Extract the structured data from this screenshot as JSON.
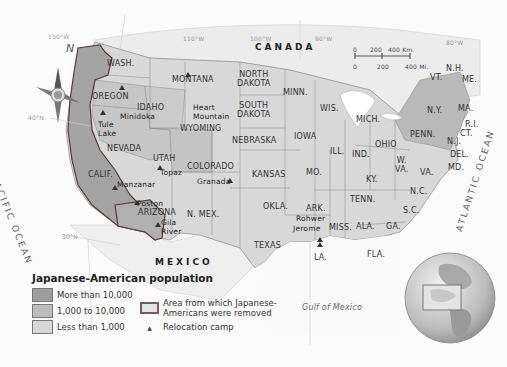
{
  "map": {
    "title": "Japanese-American population",
    "countries": {
      "canada": "CANADA",
      "mexico": "MEXICO"
    },
    "water": {
      "pacific": "PACIFIC OCEAN",
      "atlantic": "ATLANTIC OCEAN",
      "gulf": "Gulf of Mexico"
    },
    "coordinates": {
      "lon150": "150°W",
      "lon110": "110°W",
      "lon100": "100°W",
      "lon90": "90°W",
      "lon80": "80°W",
      "lat40": "40°N",
      "lat30": "30°N"
    },
    "compass": {
      "north": "N"
    },
    "scale": {
      "km_0": "0",
      "km_200": "200",
      "km_400": "400 Km.",
      "mi_0": "0",
      "mi_200": "200",
      "mi_400": "400 Mi."
    },
    "states": {
      "wash": "WASH.",
      "oregon": "OREGON",
      "idaho": "IDAHO",
      "montana": "MONTANA",
      "wyoming": "WYOMING",
      "nevada": "NEVADA",
      "calif": "CALIF.",
      "utah": "UTAH",
      "arizona": "ARIZONA",
      "colorado": "COLORADO",
      "nmex": "N. MEX.",
      "north_dakota_1": "NORTH",
      "north_dakota_2": "DAKOTA",
      "south_dakota_1": "SOUTH",
      "south_dakota_2": "DAKOTA",
      "nebraska": "NEBRASKA",
      "kansas": "KANSAS",
      "okla": "OKLA.",
      "texas": "TEXAS",
      "minn": "MINN.",
      "iowa": "IOWA",
      "mo": "MO.",
      "ark": "ARK.",
      "la": "LA.",
      "wis": "WIS.",
      "ill": "ILL.",
      "mich": "MICH.",
      "ind": "IND.",
      "ohio": "OHIO",
      "ky": "KY.",
      "tenn": "TENN.",
      "miss": "MISS.",
      "ala": "ALA.",
      "ga": "GA.",
      "fla": "FLA.",
      "sc": "S.C.",
      "nc": "N.C.",
      "va": "VA.",
      "wva_1": "W.",
      "wva_2": "VA.",
      "penn": "PENN.",
      "ny": "N.Y.",
      "vt": "VT.",
      "nh": "N.H.",
      "me": "ME.",
      "ma": "MA.",
      "ri": "R.I.",
      "ct": "CT.",
      "nj": "N.J.",
      "del": "DEL.",
      "md": "MD."
    },
    "camps": [
      {
        "name": "Minidoka"
      },
      {
        "name": "Heart Mountain",
        "line1": "Heart",
        "line2": "Mountain"
      },
      {
        "name": "Tule Lake",
        "line1": "Tule",
        "line2": "Lake"
      },
      {
        "name": "Topaz"
      },
      {
        "name": "Manzanar"
      },
      {
        "name": "Granada"
      },
      {
        "name": "Poston"
      },
      {
        "name": "Gila River",
        "line1": "Gila",
        "line2": "River"
      },
      {
        "name": "Rohwer"
      },
      {
        "name": "Jerome"
      }
    ]
  },
  "legend": {
    "title": "Japanese-American population",
    "items": [
      {
        "label": "More than 10,000",
        "color": "#9d9d9d"
      },
      {
        "label": "1,000 to 10,000",
        "color": "#bcbcbc"
      },
      {
        "label": "Less than 1,000",
        "color": "#d8d8d8"
      }
    ],
    "area_removed_1": "Area from which Japanese-",
    "area_removed_2": "Americans were removed",
    "relocation_camp": "Relocation camp",
    "camp_symbol": "▲"
  }
}
